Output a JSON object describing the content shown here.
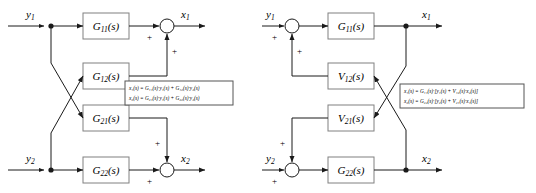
{
  "figure": {
    "background": "#ffffff",
    "line_color": "#1a1a1a",
    "block_fill": "#ffffff",
    "block_stroke": "#808080",
    "eqbox_stroke": "#555555"
  },
  "left_diagram": {
    "name": "p-canonical-structure",
    "inputs": [
      {
        "label": "y1",
        "sub": "1",
        "base": "y"
      },
      {
        "label": "y2",
        "sub": "2",
        "base": "y"
      }
    ],
    "outputs": [
      {
        "label": "x1",
        "sub": "1",
        "base": "x"
      },
      {
        "label": "x2",
        "sub": "2",
        "base": "x"
      }
    ],
    "blocks": [
      {
        "id": "G11",
        "base": "G",
        "sub": "11",
        "arg": "(s)",
        "label": "G11(s)"
      },
      {
        "id": "G12",
        "base": "G",
        "sub": "12",
        "arg": "(s)",
        "label": "G12(s)"
      },
      {
        "id": "G21",
        "base": "G",
        "sub": "21",
        "arg": "(s)",
        "label": "G21(s)"
      },
      {
        "id": "G22",
        "base": "G",
        "sub": "22",
        "arg": "(s)",
        "label": "G22(s)"
      }
    ],
    "summing_junctions": [
      {
        "id": "sum1",
        "signs": [
          "+",
          "+"
        ]
      },
      {
        "id": "sum2",
        "signs": [
          "+",
          "+"
        ]
      }
    ],
    "equations": [
      "x₁(s) = G₁₁(s)·y₁(s) + G₁₂(s)·y₂(s)",
      "x₂(s) = G₂₁(s)·y₁(s) + G₂₂(s)·y₂(s)"
    ]
  },
  "right_diagram": {
    "name": "v-canonical-structure",
    "inputs": [
      {
        "label": "y1",
        "sub": "1",
        "base": "y"
      },
      {
        "label": "y2",
        "sub": "2",
        "base": "y"
      }
    ],
    "outputs": [
      {
        "label": "x1",
        "sub": "1",
        "base": "x"
      },
      {
        "label": "x2",
        "sub": "2",
        "base": "x"
      }
    ],
    "blocks": [
      {
        "id": "G11",
        "base": "G",
        "sub": "11",
        "arg": "(s)",
        "label": "G11(s)"
      },
      {
        "id": "V12",
        "base": "V",
        "sub": "12",
        "arg": "(s)",
        "label": "V12(s)"
      },
      {
        "id": "V21",
        "base": "V",
        "sub": "21",
        "arg": "(s)",
        "label": "V21(s)"
      },
      {
        "id": "G22",
        "base": "G",
        "sub": "22",
        "arg": "(s)",
        "label": "G22(s)"
      }
    ],
    "summing_junctions": [
      {
        "id": "sum1",
        "signs": [
          "+",
          "+"
        ]
      },
      {
        "id": "sum2",
        "signs": [
          "+",
          "+"
        ]
      }
    ],
    "equations": [
      "x₁(s) = G₁₁(s)·[y₁(s) + V₁₂(s)·x₂(s)]",
      "x₂(s) = G₂₂(s)·[y₂(s) + V₂₁(s)·x₁(s)]"
    ]
  }
}
